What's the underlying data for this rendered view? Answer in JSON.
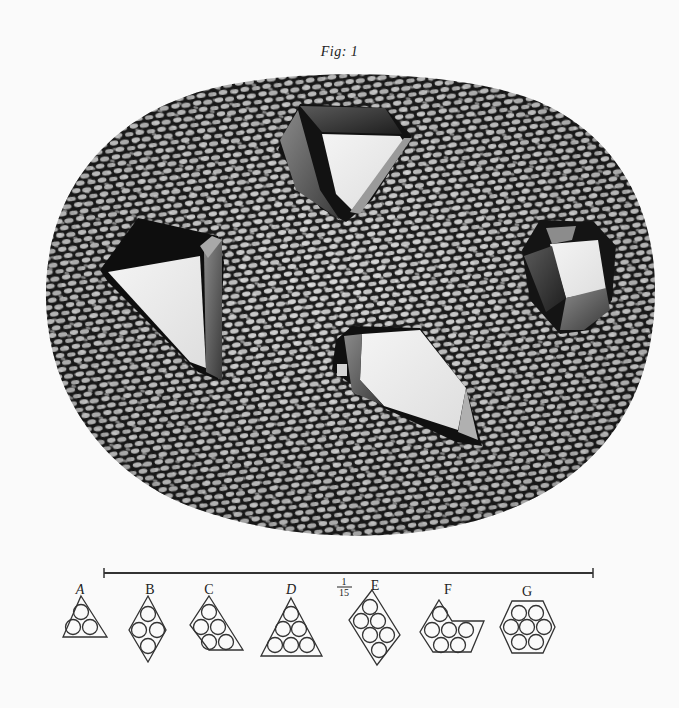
{
  "figure": {
    "title": "Fig: 1",
    "background_color": "#fafafa",
    "ink_color": "#1a1a1a"
  },
  "specimen": {
    "description": "Oval field of small rounded granules (gravel/sand texture) with four embedded crystals",
    "crystals": [
      {
        "id": "top",
        "shape": "hexagonal prism viewed at angle"
      },
      {
        "id": "left",
        "shape": "triangular-faced crystal"
      },
      {
        "id": "right",
        "shape": "hexagonal prism, small"
      },
      {
        "id": "center",
        "shape": "elongated rhombic crystal"
      }
    ]
  },
  "scale_bar": {
    "fraction_numerator": "1",
    "fraction_denominator": "15"
  },
  "packing_diagrams": [
    {
      "label": "A",
      "italic": true,
      "shape": "triangle",
      "circles": 3
    },
    {
      "label": "B",
      "italic": false,
      "shape": "rhombus",
      "circles": 4
    },
    {
      "label": "C",
      "italic": false,
      "shape": "parallelogram",
      "circles": 6
    },
    {
      "label": "D",
      "italic": true,
      "shape": "triangle",
      "circles": 6
    },
    {
      "label": "E",
      "italic": false,
      "shape": "rhombus",
      "circles": 7
    },
    {
      "label": "F",
      "italic": false,
      "shape": "trapezoid",
      "circles": 6
    },
    {
      "label": "G",
      "italic": false,
      "shape": "hexagon",
      "circles": 7
    }
  ]
}
